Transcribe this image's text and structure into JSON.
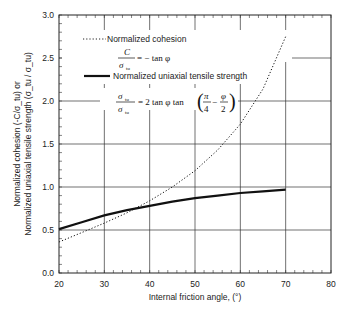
{
  "chart_data": {
    "type": "line",
    "title": "",
    "xlabel": "Internal friction angle, (°)",
    "ylabel_line1": "Normalized cohesion (-C/σ_tu) or",
    "ylabel_line2": "Normalized uniaxial tensile strength (σ_tu / σ_tu)",
    "xlim": [
      20,
      80
    ],
    "ylim": [
      0.0,
      3.0
    ],
    "xticks": [
      "20",
      "30",
      "40",
      "50",
      "60",
      "70",
      "80"
    ],
    "yticks": [
      "0.0",
      "0.5",
      "1.0",
      "1.5",
      "2.0",
      "2.5",
      "3.0"
    ],
    "grid": true,
    "legend_position": "upper left",
    "series": [
      {
        "name": "Normalized cohesion",
        "style": "dotted",
        "equation": "C/σ_tu = −tan φ",
        "x": [
          20,
          25,
          30,
          35,
          40,
          45,
          50,
          55,
          60,
          65,
          70
        ],
        "values": [
          0.36,
          0.47,
          0.58,
          0.7,
          0.84,
          1.0,
          1.19,
          1.43,
          1.73,
          2.14,
          2.75
        ]
      },
      {
        "name": "Normalized uniaxial tensile strength",
        "style": "solid",
        "equation": "σ_tu/σ_tu = 2 tan φ tan(π/4 − φ/2)",
        "x": [
          20,
          25,
          30,
          35,
          40,
          45,
          50,
          55,
          60,
          65,
          70
        ],
        "values": [
          0.51,
          0.59,
          0.67,
          0.73,
          0.78,
          0.83,
          0.87,
          0.9,
          0.93,
          0.95,
          0.97
        ]
      }
    ]
  },
  "legend": {
    "cohesion_label": "Normalized cohesion",
    "tensile_label": "Normalized uniaxial tensile strength"
  },
  "equations": {
    "cohesion_num": "C",
    "cohesion_den": "σ",
    "cohesion_den_sub": "tu",
    "cohesion_rhs": "= − tan φ",
    "tensile_num": "σ",
    "tensile_num_sub": "tu",
    "tensile_den": "σ",
    "tensile_den_sub": "tu",
    "tensile_rhs": "= 2 tan φ tan",
    "pi": "π",
    "four": "4",
    "phi": "φ",
    "two": "2",
    "minus": "−"
  }
}
